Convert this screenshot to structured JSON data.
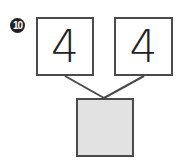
{
  "problem": {
    "number_label": "10",
    "top_left_value": "4",
    "top_right_value": "4",
    "answer_value": ""
  },
  "colors": {
    "border": "#4a4a4a",
    "answer_fill": "#e2e2e2",
    "badge_fill": "#222222"
  }
}
